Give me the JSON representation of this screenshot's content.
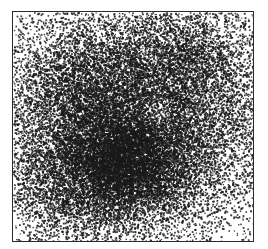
{
  "figure": {
    "title": "",
    "caption": "",
    "width_px": 268,
    "height_px": 249,
    "background_color": "#ffffff"
  },
  "panel": {
    "name": "stipple-density-panel",
    "left_px": 12,
    "top_px": 11,
    "width_px": 242,
    "height_px": 231,
    "border_color": "#2b2b2b",
    "border_width_px": 1,
    "fill_color": "#ffffff",
    "axis_ticks_visible": false,
    "axis_labels_visible": false,
    "legend_visible": false,
    "gridlines_visible": false
  },
  "chart_data": {
    "type": "scatter",
    "title": "",
    "subtitle": "",
    "xlabel": "",
    "ylabel": "",
    "xlim": [
      0,
      1
    ],
    "ylim": [
      0,
      1
    ],
    "grid": false,
    "legend": null,
    "tick_labels_x": [],
    "tick_labels_y": [],
    "annotations": [],
    "marker": {
      "shape": "square-pixel",
      "size_px": 1.5,
      "color": "#1a1a1a",
      "opacity": 0.85
    },
    "point_count": 26000,
    "description": "Dense monochrome stipple of small dark points on white, forming a diffuse radial density cloud that is densest near the centre-left of the panel and thins out toward all four corners.",
    "density_model": "sum-of-gaussian-blobs",
    "density_blobs": [
      {
        "name": "primary-core",
        "cx": 0.44,
        "cy": 0.52,
        "sx": 0.3,
        "sy": 0.3,
        "weight": 1.0
      },
      {
        "name": "lower-dark-cluster",
        "cx": 0.47,
        "cy": 0.66,
        "sx": 0.13,
        "sy": 0.12,
        "weight": 0.55
      },
      {
        "name": "upper-left-lobe",
        "cx": 0.31,
        "cy": 0.36,
        "sx": 0.17,
        "sy": 0.17,
        "weight": 0.34
      },
      {
        "name": "right-lobe",
        "cx": 0.78,
        "cy": 0.48,
        "sx": 0.18,
        "sy": 0.22,
        "weight": 0.26
      },
      {
        "name": "upper-right-lobe",
        "cx": 0.7,
        "cy": 0.18,
        "sx": 0.16,
        "sy": 0.14,
        "weight": 0.2
      },
      {
        "name": "lower-left-lobe",
        "cx": 0.22,
        "cy": 0.74,
        "sx": 0.16,
        "sy": 0.15,
        "weight": 0.18
      },
      {
        "name": "uniform-background",
        "cx": 0.5,
        "cy": 0.5,
        "sx": 2.2,
        "sy": 2.2,
        "weight": 0.42
      }
    ],
    "void_blobs": [
      {
        "name": "centre-bright-gap",
        "cx": 0.6,
        "cy": 0.42,
        "r": 0.075,
        "strength": 0.45
      },
      {
        "name": "left-bright-gap",
        "cx": 0.17,
        "cy": 0.47,
        "r": 0.06,
        "strength": 0.32
      },
      {
        "name": "lower-bright-gap",
        "cx": 0.55,
        "cy": 0.86,
        "r": 0.07,
        "strength": 0.38
      }
    ],
    "random_seed": 20240517
  }
}
